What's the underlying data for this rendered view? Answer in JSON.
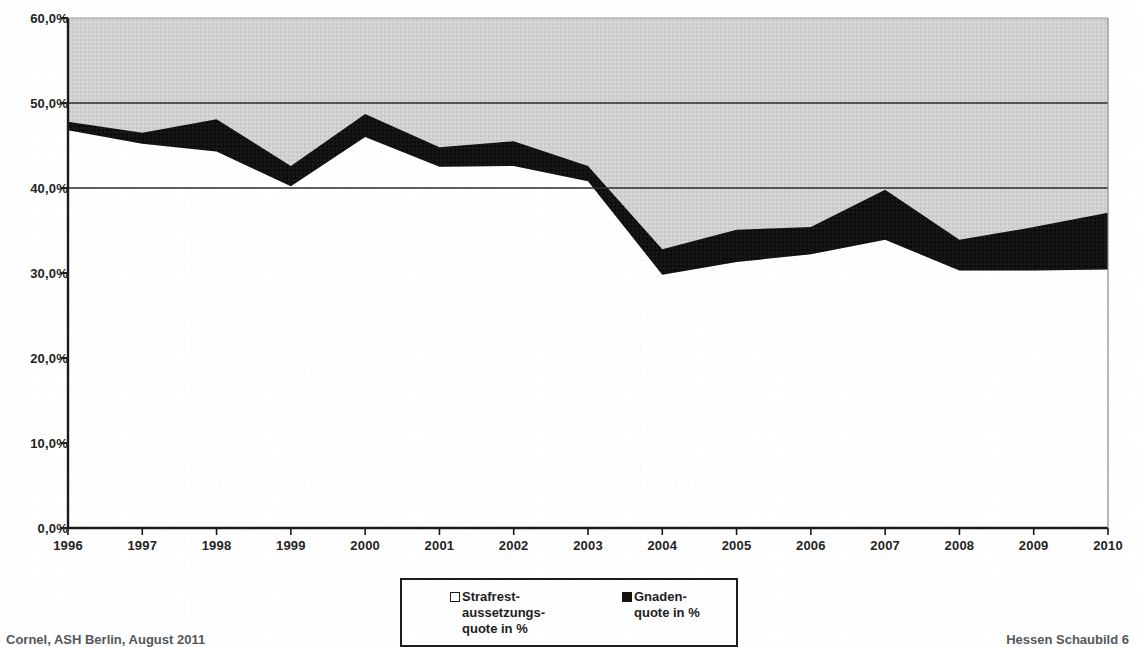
{
  "footer": {
    "left": "Cornel, ASH Berlin, August 2011",
    "right": "Hessen Schaubild 6"
  },
  "legend": {
    "items": [
      {
        "label": "Strafrest-\naussetzungs-\nquote in %",
        "marker": "hollow-square-icon",
        "color": "#ffffff"
      },
      {
        "label": "Gnaden-\nquote in %",
        "marker": "filled-square-icon",
        "color": "#121212"
      }
    ]
  },
  "axes": {
    "y_ticks": [
      "0,0%",
      "10,0%",
      "20,0%",
      "30,0%",
      "40,0%",
      "50,0%",
      "60,0%"
    ],
    "x_ticks": [
      "1996",
      "1997",
      "1998",
      "1999",
      "2000",
      "2001",
      "2002",
      "2003",
      "2004",
      "2005",
      "2006",
      "2007",
      "2008",
      "2009",
      "2010"
    ]
  },
  "chart_data": {
    "type": "area",
    "title": "",
    "subtitle": "",
    "xlabel": "",
    "ylabel": "",
    "stacked": true,
    "grid": true,
    "gridlines": [
      40.0,
      50.0
    ],
    "legend_position": "bottom-center",
    "ylim": [
      0,
      60
    ],
    "ytick_values": [
      0,
      10,
      20,
      30,
      40,
      50,
      60
    ],
    "ytick_labels": [
      "0,0%",
      "10,0%",
      "20,0%",
      "30,0%",
      "40,0%",
      "50,0%",
      "60,0%"
    ],
    "x": [
      1996,
      1997,
      1998,
      1999,
      2000,
      2001,
      2002,
      2003,
      2004,
      2005,
      2006,
      2007,
      2008,
      2009,
      2010
    ],
    "categories": [
      "1996",
      "1997",
      "1998",
      "1999",
      "2000",
      "2001",
      "2002",
      "2003",
      "2004",
      "2005",
      "2006",
      "2007",
      "2008",
      "2009",
      "2010"
    ],
    "series": [
      {
        "name": "Strafrestaussetzungsquote in %",
        "color": "#ffffff",
        "values": [
          46.8,
          45.2,
          44.3,
          40.2,
          46.0,
          42.5,
          42.6,
          40.8,
          29.8,
          31.3,
          32.2,
          33.9,
          30.3,
          30.3,
          30.4
        ]
      },
      {
        "name": "Gnadenquote in %",
        "color": "#121212",
        "values": [
          1.0,
          1.3,
          3.8,
          2.4,
          2.7,
          2.3,
          2.9,
          1.8,
          3.0,
          3.8,
          3.2,
          5.9,
          3.6,
          5.1,
          6.7
        ]
      }
    ],
    "totals": [
      47.8,
      46.5,
      48.1,
      42.6,
      48.7,
      44.8,
      45.5,
      42.6,
      32.8,
      35.1,
      35.4,
      39.8,
      33.9,
      35.4,
      37.1
    ],
    "background_band_color": "#d0d0d0",
    "plot_background": "#d0d0d0"
  }
}
